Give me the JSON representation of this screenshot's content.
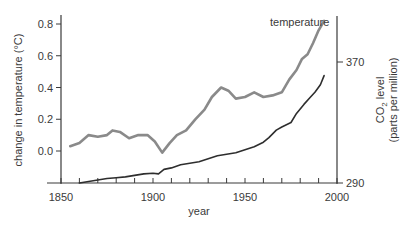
{
  "chart_data": {
    "type": "line",
    "title": "",
    "xlabel": "year",
    "ylabel_left": "change in temperature (°C)",
    "ylabel_right_line1": "CO2 level",
    "ylabel_right_line2": "(parts per million)",
    "xlim": [
      1850,
      2000
    ],
    "ylim_left": [
      -0.2,
      0.85
    ],
    "ylim_right": [
      290,
      385
    ],
    "x_ticks": [
      1850,
      1900,
      1950,
      2000
    ],
    "x_tick_labels": [
      "1850",
      "1900",
      "1950",
      "2000"
    ],
    "y_left_ticks": [
      0.0,
      0.2,
      0.4,
      0.6,
      0.8
    ],
    "y_left_tick_labels": [
      "0.0",
      "0.2",
      "0.4",
      "0.6",
      "0.8"
    ],
    "y_right_ticks": [
      290,
      370
    ],
    "y_right_tick_labels": [
      "290",
      "370"
    ],
    "grid": false,
    "annotations": [
      {
        "text": "temperature",
        "near_series": "temperature"
      }
    ],
    "series": [
      {
        "name": "temperature",
        "axis": "left",
        "color": "#8a8a8a",
        "x": [
          1855,
          1860,
          1865,
          1870,
          1875,
          1878,
          1882,
          1887,
          1892,
          1897,
          1901,
          1905,
          1909,
          1913,
          1918,
          1923,
          1928,
          1932,
          1937,
          1941,
          1945,
          1950,
          1955,
          1960,
          1965,
          1970,
          1974,
          1978,
          1981,
          1984,
          1987,
          1990,
          1993
        ],
        "values": [
          0.03,
          0.05,
          0.1,
          0.09,
          0.1,
          0.13,
          0.12,
          0.08,
          0.1,
          0.1,
          0.06,
          -0.01,
          0.05,
          0.1,
          0.13,
          0.2,
          0.26,
          0.34,
          0.4,
          0.38,
          0.33,
          0.34,
          0.37,
          0.34,
          0.35,
          0.37,
          0.45,
          0.51,
          0.58,
          0.61,
          0.68,
          0.76,
          0.82
        ]
      },
      {
        "name": "CO2 level",
        "axis": "right",
        "color": "#2e2e2e",
        "x": [
          1860,
          1865,
          1870,
          1875,
          1880,
          1885,
          1890,
          1895,
          1900,
          1903,
          1906,
          1910,
          1915,
          1920,
          1925,
          1930,
          1935,
          1940,
          1945,
          1950,
          1955,
          1960,
          1963,
          1967,
          1970,
          1975,
          1978,
          1982,
          1985,
          1988,
          1991,
          1993
        ],
        "values": [
          290,
          291,
          292,
          293,
          293.5,
          294,
          295,
          296,
          296.5,
          296,
          299,
          300,
          302,
          303,
          304,
          306,
          308,
          309,
          310,
          312,
          314,
          317,
          320,
          325,
          327,
          330,
          336,
          342,
          346,
          350,
          355,
          361
        ]
      }
    ]
  },
  "figure": {
    "annotation_temperature": "temperature"
  }
}
